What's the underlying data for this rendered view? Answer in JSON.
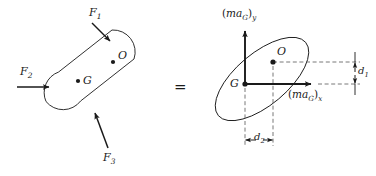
{
  "figure": {
    "equals_sign": "=",
    "colors": {
      "stroke": "#1a1a1a",
      "dashed": "#555555",
      "background": "#ffffff",
      "text": "#1a1a1a"
    }
  },
  "free_body_diagram": {
    "name": "free-body-diagram",
    "body_shape": "tilted-rounded-ellipse",
    "forces": [
      {
        "id": "F1",
        "base": "F",
        "subscript": "1",
        "direction": "down-right",
        "applied_edge": "upper-left"
      },
      {
        "id": "F2",
        "base": "F",
        "subscript": "2",
        "direction": "right",
        "applied_edge": "left"
      },
      {
        "id": "F3",
        "base": "F",
        "subscript": "3",
        "direction": "up-left",
        "applied_edge": "lower"
      }
    ],
    "points": [
      {
        "id": "G",
        "label": "G",
        "description": "center-of-mass"
      },
      {
        "id": "O",
        "label": "O",
        "description": "arbitrary-point"
      }
    ]
  },
  "kinetic_diagram": {
    "name": "kinetic-diagram",
    "body_shape": "tilted-ellipse",
    "vectors": [
      {
        "id": "maGy",
        "open": "(",
        "base": "ma",
        "base_sub": "G",
        "close": ")",
        "component": "y",
        "direction": "up",
        "origin": "G"
      },
      {
        "id": "maGx",
        "open": "(",
        "base": "ma",
        "base_sub": "G",
        "close": ")",
        "component": "x",
        "direction": "right",
        "origin": "G"
      }
    ],
    "points": [
      {
        "id": "G",
        "label": "G",
        "description": "center-of-mass-origin"
      },
      {
        "id": "O",
        "label": "O",
        "description": "arbitrary-point"
      }
    ],
    "dimensions": [
      {
        "id": "d1",
        "base": "d",
        "subscript": "1",
        "orientation": "vertical",
        "description": "vertical-offset-of-O-from-G"
      },
      {
        "id": "d2",
        "base": "d",
        "subscript": "2",
        "orientation": "horizontal",
        "description": "horizontal-offset-of-O-from-G"
      }
    ]
  }
}
